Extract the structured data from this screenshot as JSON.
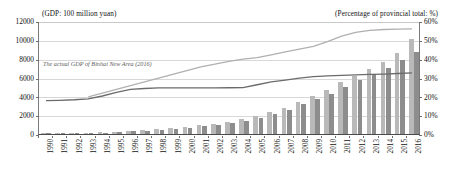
{
  "chart_data": {
    "type": "bar",
    "title": "",
    "subtitle": "",
    "xlabel": "",
    "ylabel": "(GDP: 100 million yuan)",
    "y2label": "(Percentage of provincial total: %)",
    "grid": true,
    "legend_position": "none",
    "ylim": [
      0,
      12000
    ],
    "y2lim": [
      0,
      60
    ],
    "yticks": [
      "0",
      "2000",
      "4000",
      "6000",
      "8000",
      "10000",
      "12000"
    ],
    "ytick_values": [
      0,
      2000,
      4000,
      6000,
      8000,
      10000,
      12000
    ],
    "y2ticks": [
      "0%",
      "10%",
      "20%",
      "30%",
      "40%",
      "50%",
      "60%"
    ],
    "y2tick_values": [
      0,
      10,
      20,
      30,
      40,
      50,
      60
    ],
    "categories": [
      "1990",
      "1991",
      "1992",
      "1993",
      "1994",
      "1995",
      "1996",
      "1997",
      "1998",
      "1999",
      "2000",
      "2001",
      "2002",
      "2003",
      "2004",
      "2005",
      "2006",
      "2007",
      "2008",
      "2009",
      "2010",
      "2011",
      "2012",
      "2013",
      "2014",
      "2015",
      "2016"
    ],
    "series": [
      {
        "name": "bar-series-a",
        "type": "bar",
        "axis": "left",
        "color": "#b9b9b9",
        "values": [
          60,
          75,
          95,
          130,
          190,
          260,
          340,
          430,
          520,
          650,
          790,
          930,
          1080,
          1300,
          1580,
          1900,
          2300,
          2800,
          3400,
          4000,
          4700,
          5500,
          6200,
          6900,
          7700,
          8600,
          10100
        ]
      },
      {
        "name": "bar-series-b",
        "type": "bar",
        "axis": "left",
        "color": "#8d8d8d",
        "values": [
          50,
          62,
          80,
          110,
          160,
          220,
          290,
          370,
          450,
          560,
          690,
          820,
          960,
          1150,
          1420,
          1750,
          2150,
          2600,
          3150,
          3700,
          4300,
          5000,
          5700,
          6350,
          7050,
          7900,
          8700
        ]
      },
      {
        "name": "line-upper",
        "type": "line",
        "axis": "right",
        "color": "#b0b0b0",
        "label": "The actual GDP of Binhai New Area (2016)",
        "values": [
          null,
          null,
          null,
          20.0,
          22.0,
          24.0,
          26.0,
          28.0,
          30.0,
          32.0,
          34.0,
          36.0,
          37.5,
          39.0,
          40.2,
          41.0,
          42.5,
          44.0,
          45.5,
          47.0,
          49.5,
          52.5,
          54.5,
          55.5,
          56.0,
          56.2,
          56.3
        ]
      },
      {
        "name": "line-lower",
        "type": "line",
        "axis": "right",
        "color": "#6b6b6b",
        "values": [
          18.0,
          18.2,
          18.5,
          19.0,
          20.5,
          22.5,
          24.0,
          24.5,
          24.8,
          24.8,
          24.8,
          24.8,
          24.8,
          24.9,
          25.0,
          26.5,
          28.0,
          29.0,
          30.0,
          30.8,
          31.2,
          31.5,
          31.8,
          32.0,
          32.2,
          32.5,
          32.8
        ]
      }
    ],
    "annotations": [
      {
        "text": "The actual GDP of Binhai New Area (2016)",
        "x": "1993",
        "y": 7000
      }
    ]
  }
}
